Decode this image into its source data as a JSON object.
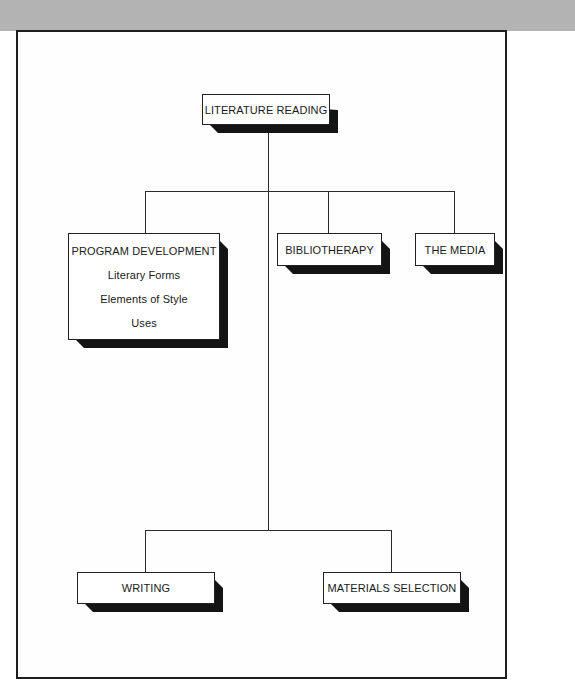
{
  "diagram": {
    "root": {
      "label": "LITERATURE READING"
    },
    "level1": [
      {
        "label": "PROGRAM DEVELOPMENT",
        "subitems": [
          "Literary Forms",
          "Elements of Style",
          "Uses"
        ]
      },
      {
        "label": "BIBLIOTHERAPY"
      },
      {
        "label": "THE MEDIA"
      }
    ],
    "level2": [
      {
        "label": "WRITING"
      },
      {
        "label": "MATERIALS SELECTION"
      }
    ]
  },
  "colors": {
    "header_band": "#b3b3b3",
    "frame_border": "#1e1e1e",
    "box_shadow": "#141414",
    "background": "#ffffff"
  }
}
